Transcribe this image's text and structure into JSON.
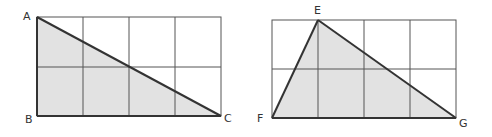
{
  "figures": [
    {
      "name": "left-figure",
      "grid": {
        "cols": 4,
        "rows": 2
      },
      "triangle": [
        "A",
        "B",
        "C"
      ],
      "labels": {
        "A": "A",
        "B": "B",
        "C": "C"
      }
    },
    {
      "name": "right-figure",
      "grid": {
        "cols": 4,
        "rows": 2
      },
      "triangle": [
        "E",
        "F",
        "G"
      ],
      "labels": {
        "E": "E",
        "F": "F",
        "G": "G"
      }
    }
  ],
  "colors": {
    "fill": "#e2e2e2",
    "grid": "#555555",
    "edge": "#333333",
    "background": "#ffffff"
  }
}
